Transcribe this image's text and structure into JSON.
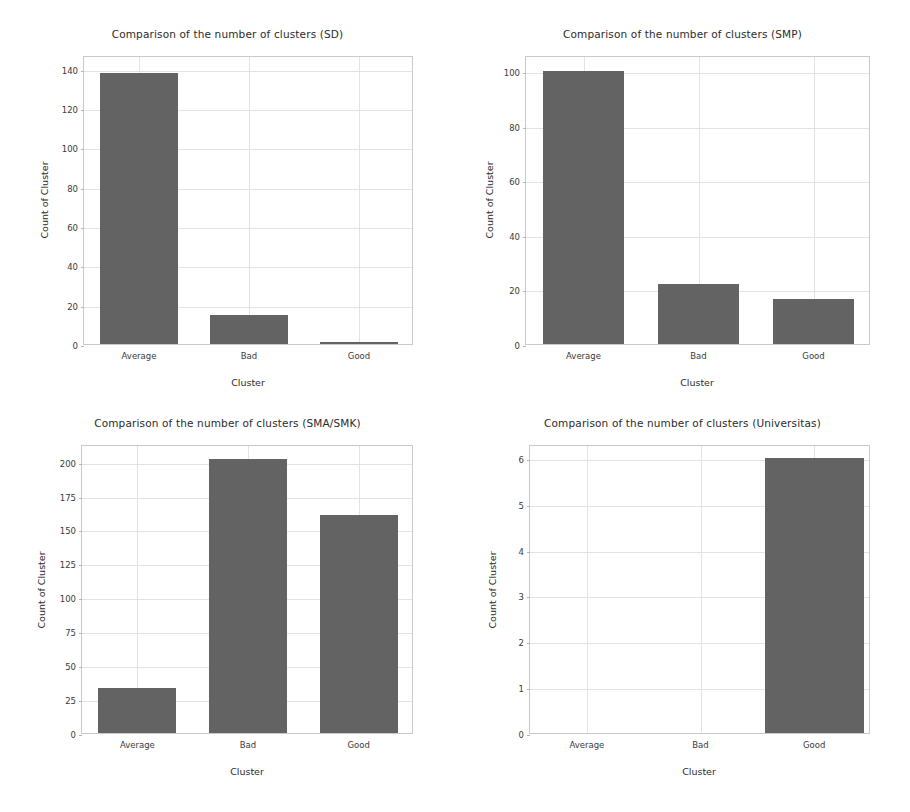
{
  "figure": {
    "background_color": "#ffffff",
    "bar_color": "#636363",
    "grid_color": "#e3e3e3",
    "axis_color": "#c9c9c9",
    "text_color": "#2b2b2b",
    "layout": "2x2 grid of bar charts"
  },
  "chart_data": [
    {
      "type": "bar",
      "id": "sd",
      "title": "Comparison of the number of clusters (SD)",
      "xlabel": "Cluster",
      "ylabel": "Count of Cluster",
      "categories": [
        "Average",
        "Bad",
        "Good"
      ],
      "values": [
        138,
        15,
        1
      ],
      "ylim": [
        0,
        147
      ],
      "yticks": [
        0,
        20,
        40,
        60,
        80,
        100,
        120,
        140
      ],
      "ytick_labels": [
        "0",
        "20",
        "40",
        "60",
        "80",
        "100",
        "120",
        "140"
      ],
      "grid": true,
      "legend": "none"
    },
    {
      "type": "bar",
      "id": "smp",
      "title": "Comparison of the number of clusters (SMP)",
      "xlabel": "Cluster",
      "ylabel": "Count of Cluster",
      "categories": [
        "Average",
        "Bad",
        "Good"
      ],
      "values": [
        100,
        22,
        16.5
      ],
      "ylim": [
        0,
        106
      ],
      "yticks": [
        0,
        20,
        40,
        60,
        80,
        100
      ],
      "ytick_labels": [
        "0",
        "20",
        "40",
        "60",
        "80",
        "100"
      ],
      "grid": true,
      "legend": "none"
    },
    {
      "type": "bar",
      "id": "sma-smk",
      "title": "Comparison of the number of clusters (SMA/SMK)",
      "xlabel": "Cluster",
      "ylabel": "Count of Cluster",
      "categories": [
        "Average",
        "Bad",
        "Good"
      ],
      "values": [
        33,
        202,
        161
      ],
      "ylim": [
        0,
        213
      ],
      "yticks": [
        0,
        25,
        50,
        75,
        100,
        125,
        150,
        175,
        200
      ],
      "ytick_labels": [
        "0",
        "25",
        "50",
        "75",
        "100",
        "125",
        "150",
        "175",
        "200"
      ],
      "grid": true,
      "legend": "none"
    },
    {
      "type": "bar",
      "id": "universitas",
      "title": "Comparison of the number of clusters (Universitas)",
      "xlabel": "Cluster",
      "ylabel": "Count of Cluster",
      "categories": [
        "Average",
        "Bad",
        "Good"
      ],
      "values": [
        0,
        0,
        6
      ],
      "ylim": [
        0,
        6.3
      ],
      "yticks": [
        0,
        1,
        2,
        3,
        4,
        5,
        6
      ],
      "ytick_labels": [
        "0",
        "1",
        "2",
        "3",
        "4",
        "5",
        "6"
      ],
      "grid": true,
      "legend": "none"
    }
  ]
}
